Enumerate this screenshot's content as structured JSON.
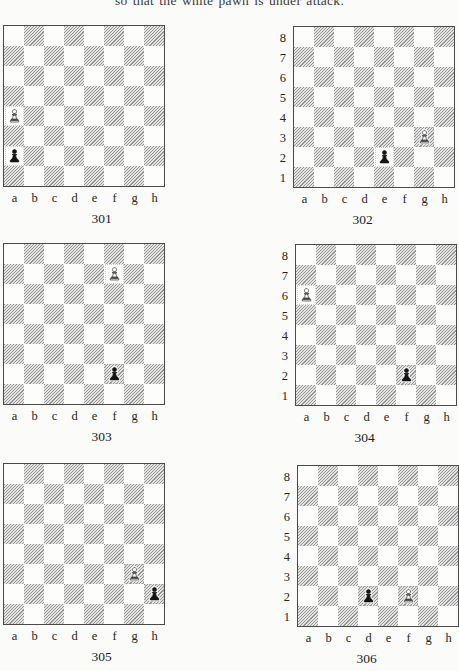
{
  "page": {
    "heading": "so that the white pawn is under attack.",
    "colors": {
      "page_background": "#fbfbf9",
      "board_border": "#4b4b4b",
      "dark_square_hatch": "#979797",
      "light_square": "#fdfdfc",
      "white_piece": "#ffffff",
      "black_piece": "#151515"
    }
  },
  "board_defaults": {
    "files": [
      "a",
      "b",
      "c",
      "d",
      "e",
      "f",
      "g",
      "h"
    ],
    "ranks": [
      "8",
      "7",
      "6",
      "5",
      "4",
      "3",
      "2",
      "1"
    ]
  },
  "diagrams": [
    {
      "caption": "301",
      "show_rank_labels": false,
      "pieces": [
        {
          "square": "a4",
          "piece": "white-pawn"
        },
        {
          "square": "a2",
          "piece": "black-pawn"
        }
      ]
    },
    {
      "caption": "302",
      "show_rank_labels": true,
      "pieces": [
        {
          "square": "g3",
          "piece": "white-pawn"
        },
        {
          "square": "e2",
          "piece": "black-pawn"
        }
      ]
    },
    {
      "caption": "303",
      "show_rank_labels": false,
      "pieces": [
        {
          "square": "f7",
          "piece": "white-pawn"
        },
        {
          "square": "f2",
          "piece": "black-pawn"
        }
      ]
    },
    {
      "caption": "304",
      "show_rank_labels": true,
      "pieces": [
        {
          "square": "a6",
          "piece": "white-pawn"
        },
        {
          "square": "f2",
          "piece": "black-pawn"
        }
      ]
    },
    {
      "caption": "305",
      "show_rank_labels": false,
      "pieces": [
        {
          "square": "g3",
          "piece": "white-pawn"
        },
        {
          "square": "h2",
          "piece": "black-pawn"
        }
      ]
    },
    {
      "caption": "306",
      "show_rank_labels": true,
      "pieces": [
        {
          "square": "d2",
          "piece": "black-pawn"
        },
        {
          "square": "f2",
          "piece": "white-pawn"
        }
      ]
    }
  ]
}
